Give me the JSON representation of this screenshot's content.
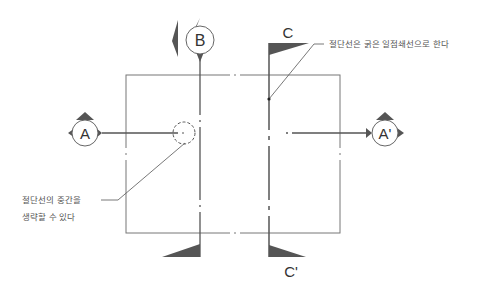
{
  "diagram": {
    "type": "section-cutting-line-notation",
    "colors": {
      "line": "#666666",
      "thick_line": "#555555",
      "arrow_fill": "#555555",
      "text": "#333333",
      "annotation_text": "#555555",
      "background": "#ffffff"
    },
    "section_labels": {
      "a": "A",
      "a_prime": "A'",
      "b": "B",
      "c": "C",
      "c_prime": "C'"
    },
    "annotations": {
      "right_note": "절단선은 굵은 일점쇄선으로 한다",
      "left_note_line1": "절단선의 중간을",
      "left_note_line2": "생략할 수 있다"
    },
    "object_rectangle": {
      "x": 126,
      "y": 75,
      "width": 214,
      "height": 158
    }
  }
}
